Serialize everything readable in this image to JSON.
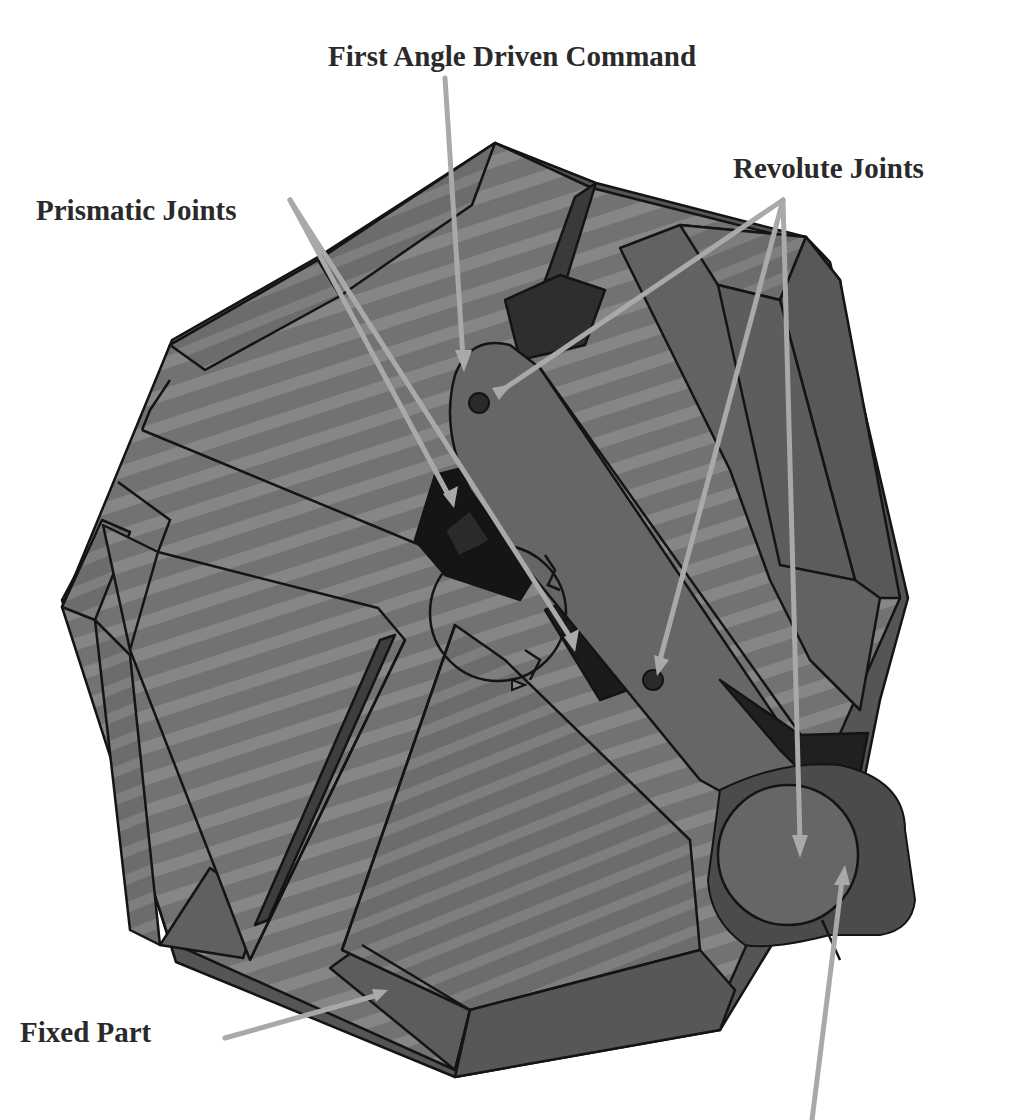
{
  "figure": {
    "colors": {
      "background": "#ffffff",
      "body_light": "#7a7a7a",
      "body_mid": "#6a6a6a",
      "body_dark": "#4f4f4f",
      "slot_black": "#151515",
      "edge": "#141414",
      "arrow": "#a9a9a9",
      "label_text": "#2a2a2a"
    }
  },
  "labels": {
    "first_angle_driven_command": "First Angle Driven Command",
    "revolute_joints": "Revolute Joints",
    "prismatic_joints": "Prismatic Joints",
    "fixed_part": "Fixed Part"
  },
  "annotations": [
    {
      "label": "First Angle Driven Command",
      "arrow_count": 1
    },
    {
      "label": "Revolute Joints",
      "arrow_count": 3
    },
    {
      "label": "Prismatic Joints",
      "arrow_count": 2
    },
    {
      "label": "Fixed Part",
      "arrow_count": 1
    },
    {
      "label": "",
      "arrow_count": 1,
      "note": "unlabeled arrow from bottom edge pointing to round knob"
    }
  ]
}
